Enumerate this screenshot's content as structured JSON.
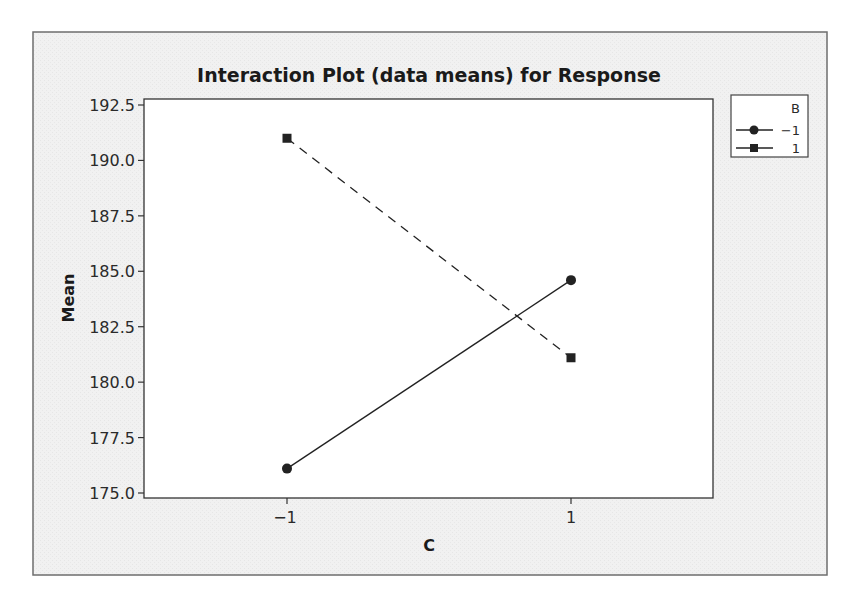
{
  "chart_data": {
    "type": "line",
    "title": "Interaction Plot (data means) for Response",
    "xlabel": "C",
    "ylabel": "Mean",
    "categories": [
      "-1",
      "1"
    ],
    "x_tick_labels": [
      "−1",
      "1"
    ],
    "y_ticks": [
      175.0,
      177.5,
      180.0,
      182.5,
      185.0,
      187.5,
      190.0,
      192.5
    ],
    "y_tick_labels": [
      "175.0",
      "177.5",
      "180.0",
      "182.5",
      "185.0",
      "187.5",
      "190.0",
      "192.5"
    ],
    "ylim": [
      175.0,
      192.5
    ],
    "grid": false,
    "legend": {
      "title": "B",
      "position": "right-top",
      "entries": [
        {
          "label": "−1",
          "marker": "circle",
          "line": "solid"
        },
        {
          "label": "1",
          "marker": "square",
          "line": "dashed"
        }
      ]
    },
    "series": [
      {
        "name": "-1",
        "marker": "circle",
        "line_style": "solid",
        "values": [
          176.1,
          184.6
        ]
      },
      {
        "name": "1",
        "marker": "square",
        "line_style": "dashed",
        "values": [
          191.0,
          181.1
        ]
      }
    ]
  },
  "colors": {
    "frame_background": "#efefef",
    "plot_background": "#ffffff",
    "frame_border": "#6e6e6e",
    "axis": "#333333",
    "series": "#222222"
  }
}
